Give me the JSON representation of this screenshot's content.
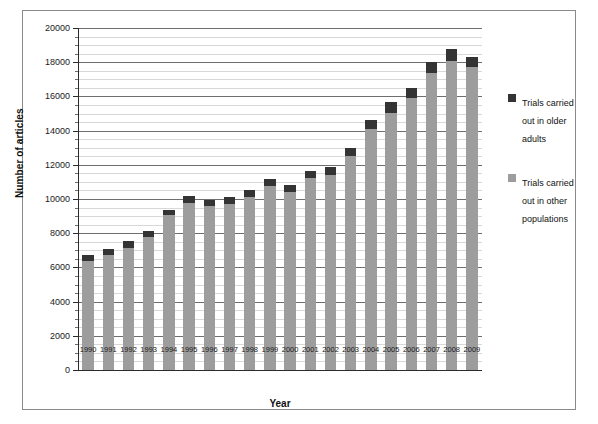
{
  "chart_data": {
    "type": "bar",
    "stacked": true,
    "title": "",
    "xlabel": "Year",
    "ylabel": "Number of articles",
    "ylim": [
      0,
      20000
    ],
    "ytick_step": 2000,
    "yticks": [
      0,
      2000,
      4000,
      6000,
      8000,
      10000,
      12000,
      14000,
      16000,
      18000,
      20000
    ],
    "minor_gridline_step": 500,
    "grid": true,
    "legend_position": "right",
    "categories": [
      "1990",
      "1991",
      "1992",
      "1993",
      "1994",
      "1995",
      "1996",
      "1997",
      "1998",
      "1999",
      "2000",
      "2001",
      "2002",
      "2003",
      "2004",
      "2005",
      "2006",
      "2007",
      "2008",
      "2009"
    ],
    "series": [
      {
        "name": "Trials carried out in other populations",
        "color": "#9d9d9d",
        "values": [
          6400,
          6750,
          7150,
          7750,
          9050,
          9750,
          9600,
          9700,
          10100,
          10750,
          10400,
          11200,
          11400,
          12500,
          14100,
          15050,
          15900,
          17350,
          18100,
          17700
        ]
      },
      {
        "name": "Trials carried out in older adults",
        "color": "#343434",
        "values": [
          350,
          350,
          400,
          400,
          300,
          400,
          350,
          400,
          400,
          450,
          400,
          450,
          450,
          500,
          550,
          600,
          600,
          650,
          700,
          600
        ]
      }
    ],
    "totals": [
      6750,
      7100,
      7550,
      8150,
      9350,
      10150,
      9950,
      10100,
      10500,
      11200,
      10800,
      11650,
      11850,
      13000,
      14650,
      15650,
      16500,
      18000,
      18800,
      18300
    ]
  },
  "legend": {
    "items": [
      {
        "label": "Trials carried out in older adults",
        "color": "#343434"
      },
      {
        "label": "Trials carried out in other populations",
        "color": "#9d9d9d"
      }
    ]
  },
  "axes": {
    "y_title": "Number of articles",
    "x_title": "Year"
  }
}
